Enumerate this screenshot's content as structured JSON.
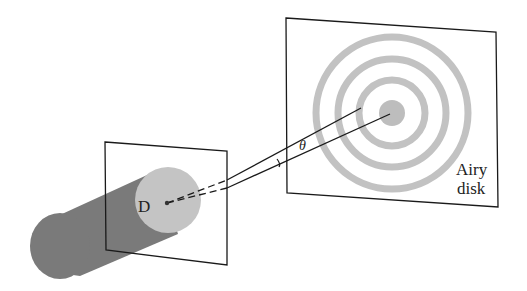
{
  "diagram": {
    "labels": {
      "aperture": "D",
      "angle": "θ",
      "pattern_line1": "Airy",
      "pattern_line2": "disk"
    },
    "colors": {
      "beam": "#7a7a7a",
      "aperture_face": "#c4c4c4",
      "rings": "#c2c2c2",
      "center_spot": "#bdbdbd",
      "lines": "#1a1a1a"
    }
  }
}
